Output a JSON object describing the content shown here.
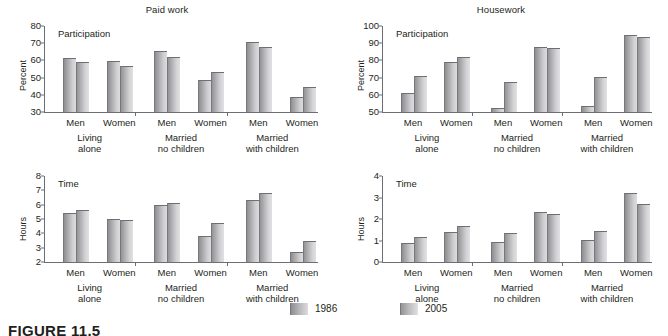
{
  "figure": {
    "caption": "FIGURE 11.5",
    "legend": [
      {
        "label": "1986",
        "color": "#b4b4b6"
      },
      {
        "label": "2005",
        "color": "#bababc"
      }
    ]
  },
  "series_names": [
    "1986",
    "2005"
  ],
  "groups": [
    {
      "label_line1": "Living",
      "label_line2": "alone"
    },
    {
      "label_line1": "Married",
      "label_line2": "no children"
    },
    {
      "label_line1": "Married",
      "label_line2": "with children"
    }
  ],
  "categories": [
    "Men",
    "Women",
    "Men",
    "Women",
    "Men",
    "Women"
  ],
  "chart_data": [
    {
      "type": "bar",
      "panel": "top-left",
      "title": "Paid work",
      "annotation": "Participation",
      "xlabel": "",
      "ylabel": "Percent",
      "ylim": [
        30,
        80
      ],
      "yticks": [
        30,
        40,
        50,
        60,
        70,
        80
      ],
      "grid": false,
      "legend_position": "bottom-center",
      "categories": [
        "Men",
        "Women",
        "Men",
        "Women",
        "Men",
        "Women"
      ],
      "groups": [
        "Living alone",
        "Living alone",
        "Married no children",
        "Married no children",
        "Married with children",
        "Married with children"
      ],
      "series": [
        {
          "name": "1986",
          "values": [
            61.5,
            59.5,
            65.5,
            48.5,
            71.0,
            38.5
          ]
        },
        {
          "name": "2005",
          "values": [
            59.0,
            56.5,
            62.0,
            53.5,
            68.0,
            44.5
          ]
        }
      ]
    },
    {
      "type": "bar",
      "panel": "top-right",
      "title": "Housework",
      "annotation": "Participation",
      "xlabel": "",
      "ylabel": "Percent",
      "ylim": [
        50,
        100
      ],
      "yticks": [
        50,
        60,
        70,
        80,
        90,
        100
      ],
      "grid": false,
      "legend_position": "bottom-center",
      "categories": [
        "Men",
        "Women",
        "Men",
        "Women",
        "Men",
        "Women"
      ],
      "groups": [
        "Living alone",
        "Living alone",
        "Married no children",
        "Married no children",
        "Married with children",
        "Married with children"
      ],
      "series": [
        {
          "name": "1986",
          "values": [
            61.0,
            79.0,
            52.5,
            88.0,
            53.5,
            95.0
          ]
        },
        {
          "name": "2005",
          "values": [
            71.0,
            82.0,
            67.5,
            87.0,
            70.5,
            93.5
          ]
        }
      ]
    },
    {
      "type": "bar",
      "panel": "bottom-left",
      "title": "",
      "annotation": "Time",
      "xlabel": "",
      "ylabel": "Hours",
      "ylim": [
        2,
        8
      ],
      "yticks": [
        2,
        3,
        4,
        5,
        6,
        7,
        8
      ],
      "grid": false,
      "legend_position": "bottom-center",
      "categories": [
        "Men",
        "Women",
        "Men",
        "Women",
        "Men",
        "Women"
      ],
      "groups": [
        "Living alone",
        "Living alone",
        "Married no children",
        "Married no children",
        "Married with children",
        "Married with children"
      ],
      "series": [
        {
          "name": "1986",
          "values": [
            5.45,
            5.0,
            6.0,
            3.8,
            6.35,
            2.7
          ]
        },
        {
          "name": "2005",
          "values": [
            5.6,
            4.95,
            6.1,
            4.75,
            6.8,
            3.5
          ]
        }
      ]
    },
    {
      "type": "bar",
      "panel": "bottom-right",
      "title": "",
      "annotation": "Time",
      "xlabel": "",
      "ylabel": "Hours",
      "ylim": [
        0,
        4
      ],
      "yticks": [
        0,
        1,
        2,
        3,
        4
      ],
      "grid": false,
      "legend_position": "bottom-center",
      "categories": [
        "Men",
        "Women",
        "Men",
        "Women",
        "Men",
        "Women"
      ],
      "groups": [
        "Living alone",
        "Living alone",
        "Married no children",
        "Married no children",
        "Married with children",
        "Married with children"
      ],
      "series": [
        {
          "name": "1986",
          "values": [
            0.9,
            1.4,
            0.92,
            2.33,
            1.02,
            3.22
          ]
        },
        {
          "name": "2005",
          "values": [
            1.18,
            1.67,
            1.35,
            2.25,
            1.45,
            2.72
          ]
        }
      ]
    }
  ]
}
